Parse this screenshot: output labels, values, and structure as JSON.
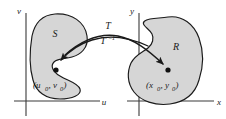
{
  "figure": {
    "colors": {
      "region_fill": "#d6d6d6",
      "region_stroke": "#1a1a1a",
      "axis_stroke": "#3a3a3a",
      "arrow_stroke": "#1a1a1a",
      "point_fill": "#111111",
      "background": "#ffffff"
    },
    "left_plane": {
      "name": "uv-plane",
      "vertical_axis_label": "v",
      "horizontal_axis_label": "u",
      "region_label": "S",
      "point_label": "(u",
      "point_label_sub1": "0",
      "point_label_mid": ", v",
      "point_label_sub2": "0",
      "point_label_end": ")"
    },
    "right_plane": {
      "name": "xy-plane",
      "vertical_axis_label": "y",
      "horizontal_axis_label": "x",
      "region_label": "R",
      "point_label": "(x",
      "point_label_sub1": "0",
      "point_label_mid": ", y",
      "point_label_sub2": "0",
      "point_label_end": ")"
    },
    "mapping": {
      "forward_label": "T",
      "inverse_label": "T",
      "inverse_exponent": "−1"
    }
  }
}
